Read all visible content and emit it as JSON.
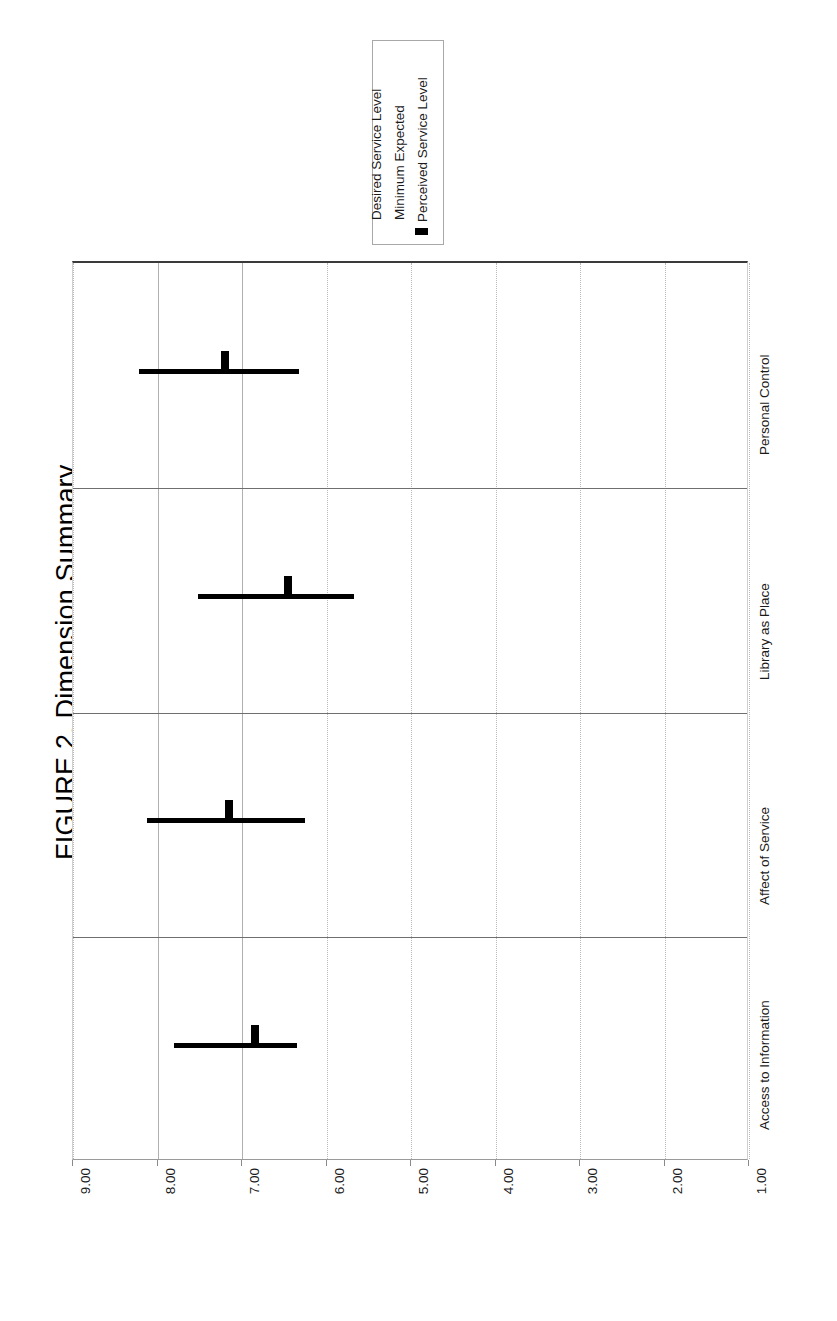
{
  "figure": {
    "title": "FIGURE 2. Dimension Summary"
  },
  "legend": {
    "entries": [
      {
        "label": "Desired Service Level",
        "marker": "none"
      },
      {
        "label": "Minimum Expected",
        "marker": "none"
      },
      {
        "label": "Perceived Service Level",
        "marker": "filled-bar-swatch"
      }
    ]
  },
  "axis": {
    "ticks": [
      "9.00",
      "8.00",
      "7.00",
      "6.00",
      "5.00",
      "4.00",
      "3.00",
      "2.00",
      "1.00"
    ]
  },
  "categories": [
    "Access to Information",
    "Affect of Service",
    "Library as Place",
    "Personal Control"
  ],
  "chart_data": {
    "type": "bar",
    "title": "FIGURE 2. Dimension Summary",
    "xlabel": "",
    "ylabel": "",
    "orientation": "horizontal-reversed-value-axis",
    "value_axis_ticks": [
      9.0,
      8.0,
      7.0,
      6.0,
      5.0,
      4.0,
      3.0,
      2.0,
      1.0
    ],
    "xlim": [
      9.0,
      1.0
    ],
    "grid": true,
    "legend_position": "top-center-inside-box",
    "categories": [
      "Access to Information",
      "Affect of Service",
      "Library as Place",
      "Personal Control"
    ],
    "series": [
      {
        "name": "Desired Service Level",
        "values": [
          7.8,
          8.12,
          7.52,
          8.22
        ]
      },
      {
        "name": "Minimum Expected",
        "values": [
          6.35,
          6.25,
          5.68,
          6.32
        ]
      },
      {
        "name": "Perceived Service Level",
        "values": [
          6.85,
          7.15,
          6.45,
          7.2
        ]
      }
    ]
  },
  "geometry": {
    "plot_left": 72,
    "plot_right": 748,
    "plot_top": 261,
    "plot_bottom": 1160,
    "value_at_left": 9.0,
    "value_at_right": 1.0
  }
}
